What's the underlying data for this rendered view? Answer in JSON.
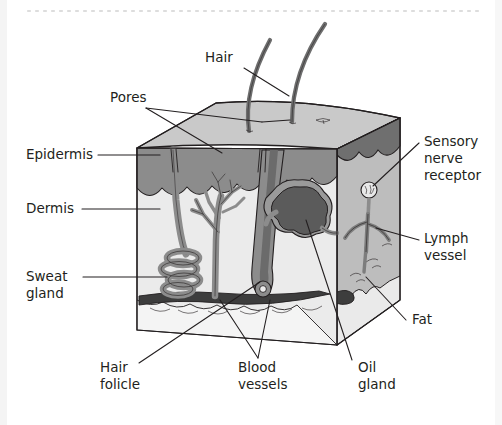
{
  "figure": {
    "background_color": "#ffffff",
    "text_color": "#231f20",
    "top_dotted_rule": {
      "present": true,
      "color": "#d9d9d9",
      "dot_count": 58
    },
    "palette": {
      "top_surface": "#c9c9c9",
      "epidermis": "#8c8c8c",
      "dermis": "#ebebeb",
      "dermis_side": "#bdbdbd",
      "fat": "#f2f2f2",
      "fat_side": "#b5b5b5",
      "structure_gray": "#8c8c8c",
      "structure_dark": "#595959",
      "vessel_dark": "#3f3f3f",
      "outline": "#231f20"
    }
  },
  "labels": [
    {
      "id": "hair",
      "text": "Hair",
      "x": 205,
      "y": 62,
      "anchor": "start",
      "lines": 1
    },
    {
      "id": "pores",
      "text": "Pores",
      "x": 110,
      "y": 102,
      "anchor": "start",
      "lines": 1
    },
    {
      "id": "epidermis",
      "text": "Epidermis",
      "x": 26,
      "y": 159,
      "anchor": "start",
      "lines": 1
    },
    {
      "id": "dermis",
      "text": "Dermis",
      "x": 26,
      "y": 213,
      "anchor": "start",
      "lines": 1
    },
    {
      "id": "sweat-gland",
      "text": "Sweat",
      "text2": "gland",
      "x": 26,
      "y": 281,
      "anchor": "start",
      "lines": 2
    },
    {
      "id": "sensory-nerve-receptor",
      "text": "Sensory",
      "text2": "nerve",
      "text3": "receptor",
      "x": 424,
      "y": 146,
      "anchor": "start",
      "lines": 3
    },
    {
      "id": "lymph-vessel",
      "text": "Lymph",
      "text2": "vessel",
      "x": 424,
      "y": 243,
      "anchor": "start",
      "lines": 2
    },
    {
      "id": "fat",
      "text": "Fat",
      "x": 412,
      "y": 324,
      "anchor": "start",
      "lines": 1
    },
    {
      "id": "hair-folicle",
      "text": "Hair",
      "text2": "folicle",
      "x": 100,
      "y": 372,
      "anchor": "start",
      "lines": 2
    },
    {
      "id": "blood-vessels",
      "text": "Blood",
      "text2": "vessels",
      "x": 238,
      "y": 372,
      "anchor": "start",
      "lines": 2
    },
    {
      "id": "oil-gland",
      "text": "Oil",
      "text2": "gland",
      "x": 358,
      "y": 372,
      "anchor": "start",
      "lines": 2
    }
  ],
  "structures": [
    {
      "id": "hair-shaft-left",
      "name": "hair-shaft",
      "count": 2
    },
    {
      "id": "epidermis-layer",
      "name": "epidermis-layer"
    },
    {
      "id": "dermis-layer",
      "name": "dermis-layer"
    },
    {
      "id": "fat-layer",
      "name": "fat-layer"
    },
    {
      "id": "sweat-gland-coil",
      "name": "sweat-gland-coil"
    },
    {
      "id": "sweat-duct",
      "name": "sweat-duct"
    },
    {
      "id": "blood-vessel-tree",
      "name": "blood-vessel-tree"
    },
    {
      "id": "blood-vessel-band",
      "name": "blood-vessel-band"
    },
    {
      "id": "hair-follicle-bulb",
      "name": "hair-follicle-bulb"
    },
    {
      "id": "oil-gland-lobes",
      "name": "oil-gland-lobes"
    },
    {
      "id": "sensory-nerve-ending",
      "name": "sensory-nerve-ending"
    },
    {
      "id": "lymph-vessel-branch",
      "name": "lymph-vessel-branch"
    },
    {
      "id": "pore-opening",
      "name": "pore-opening",
      "count": 2
    }
  ]
}
